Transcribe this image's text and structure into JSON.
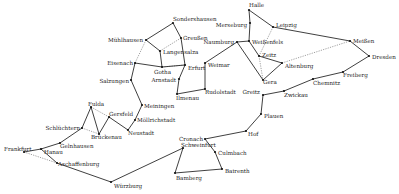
{
  "diagram": {
    "nodes": [
      {
        "id": "halle",
        "label": "Halle",
        "x": 249,
        "y": 10,
        "lx": 249,
        "ly": 6,
        "anchor": "start"
      },
      {
        "id": "leipzig",
        "label": "Leipzig",
        "x": 273,
        "y": 27,
        "lx": 276,
        "ly": 26,
        "anchor": "start"
      },
      {
        "id": "merseburg",
        "label": "Merseburg",
        "x": 250,
        "y": 23,
        "lx": 247,
        "ly": 26,
        "anchor": "end"
      },
      {
        "id": "naumburg",
        "label": "Naumburg",
        "x": 237,
        "y": 42,
        "lx": 234,
        "ly": 43,
        "anchor": "end"
      },
      {
        "id": "weissenfels",
        "label": "Weißenfels",
        "x": 249,
        "y": 41,
        "lx": 252,
        "ly": 43,
        "anchor": "start"
      },
      {
        "id": "zeitz",
        "label": "Zeitz",
        "x": 259,
        "y": 56,
        "lx": 262,
        "ly": 56,
        "anchor": "start"
      },
      {
        "id": "altenburg",
        "label": "Altenburg",
        "x": 282,
        "y": 63,
        "lx": 285,
        "ly": 67,
        "anchor": "start"
      },
      {
        "id": "gera",
        "label": "Gera",
        "x": 263,
        "y": 80,
        "lx": 263,
        "ly": 83,
        "anchor": "start"
      },
      {
        "id": "meissen",
        "label": "Meißen",
        "x": 350,
        "y": 41,
        "lx": 353,
        "ly": 42,
        "anchor": "start"
      },
      {
        "id": "dresden",
        "label": "Dresden",
        "x": 369,
        "y": 56,
        "lx": 372,
        "ly": 58,
        "anchor": "start"
      },
      {
        "id": "freiberg",
        "label": "Freiberg",
        "x": 343,
        "y": 72,
        "lx": 343,
        "ly": 76,
        "anchor": "start"
      },
      {
        "id": "chemnitz",
        "label": "Chemnitz",
        "x": 313,
        "y": 79,
        "lx": 313,
        "ly": 84,
        "anchor": "start"
      },
      {
        "id": "zwickau",
        "label": "Zwickau",
        "x": 284,
        "y": 91,
        "lx": 284,
        "ly": 96,
        "anchor": "start"
      },
      {
        "id": "greitz",
        "label": "Greitz",
        "x": 263,
        "y": 95,
        "lx": 260,
        "ly": 93,
        "anchor": "end"
      },
      {
        "id": "plauen",
        "label": "Plauen",
        "x": 261,
        "y": 114,
        "lx": 264,
        "ly": 117,
        "anchor": "start"
      },
      {
        "id": "hof",
        "label": "Hof",
        "x": 246,
        "y": 131,
        "lx": 248,
        "ly": 135,
        "anchor": "start"
      },
      {
        "id": "cronach",
        "label": "Cronach",
        "x": 205,
        "y": 139,
        "lx": 203,
        "ly": 140,
        "anchor": "end"
      },
      {
        "id": "culmbach",
        "label": "Culmbach",
        "x": 215,
        "y": 152,
        "lx": 218,
        "ly": 154,
        "anchor": "start"
      },
      {
        "id": "bairenth",
        "label": "Bairenth",
        "x": 222,
        "y": 169,
        "lx": 225,
        "ly": 172,
        "anchor": "start"
      },
      {
        "id": "bamberg",
        "label": "Bamberg",
        "x": 175,
        "y": 173,
        "lx": 176,
        "ly": 179,
        "anchor": "start"
      },
      {
        "id": "schweinfurt",
        "label": "Schweinfurt",
        "x": 183,
        "y": 148,
        "lx": 181,
        "ly": 146,
        "anchor": "start"
      },
      {
        "id": "wurzburg",
        "label": "Würzburg",
        "x": 111,
        "y": 182,
        "lx": 114,
        "ly": 187,
        "anchor": "start"
      },
      {
        "id": "aschaffenburg",
        "label": "Aschaffenburg",
        "x": 57,
        "y": 163,
        "lx": 58,
        "ly": 165,
        "anchor": "start"
      },
      {
        "id": "frankfurt",
        "label": "Frankfurt",
        "x": 24,
        "y": 152,
        "lx": 4,
        "ly": 150,
        "anchor": "start"
      },
      {
        "id": "hanau",
        "label": "Hanau",
        "x": 41,
        "y": 149,
        "lx": 44,
        "ly": 153,
        "anchor": "start"
      },
      {
        "id": "gelnhausen",
        "label": "Gelnhausen",
        "x": 60,
        "y": 143,
        "lx": 60,
        "ly": 147,
        "anchor": "start"
      },
      {
        "id": "schluchtern",
        "label": "Schlüchtern",
        "x": 82,
        "y": 128,
        "lx": 80,
        "ly": 129,
        "anchor": "end"
      },
      {
        "id": "bruckenau",
        "label": "Brückenau",
        "x": 99,
        "y": 134,
        "lx": 91,
        "ly": 138,
        "anchor": "start"
      },
      {
        "id": "fulda",
        "label": "Fulda",
        "x": 91,
        "y": 107,
        "lx": 88,
        "ly": 105,
        "anchor": "start"
      },
      {
        "id": "gersfeld",
        "label": "Gersfeld",
        "x": 109,
        "y": 117,
        "lx": 109,
        "ly": 115,
        "anchor": "start"
      },
      {
        "id": "neustadt",
        "label": "Neustadt",
        "x": 128,
        "y": 130,
        "lx": 128,
        "ly": 134,
        "anchor": "start"
      },
      {
        "id": "mellrichstadt",
        "label": "Möllrichstadt",
        "x": 135,
        "y": 120,
        "lx": 137,
        "ly": 121,
        "anchor": "start"
      },
      {
        "id": "meiningen",
        "label": "Meiningen",
        "x": 142,
        "y": 105,
        "lx": 144,
        "ly": 107,
        "anchor": "start"
      },
      {
        "id": "salzungen",
        "label": "Salzungen",
        "x": 131,
        "y": 80,
        "lx": 129,
        "ly": 82,
        "anchor": "end"
      },
      {
        "id": "eisenach",
        "label": "Eisenach",
        "x": 135,
        "y": 63,
        "lx": 133,
        "ly": 64,
        "anchor": "end"
      },
      {
        "id": "gotha",
        "label": "Gotha",
        "x": 162,
        "y": 67,
        "lx": 154,
        "ly": 73,
        "anchor": "start"
      },
      {
        "id": "arnstadt",
        "label": "Arnstadt",
        "x": 179,
        "y": 79,
        "lx": 176,
        "ly": 81,
        "anchor": "end"
      },
      {
        "id": "ilmenau",
        "label": "Ilmenau",
        "x": 177,
        "y": 94,
        "lx": 176,
        "ly": 99,
        "anchor": "start"
      },
      {
        "id": "rudolstadt",
        "label": "Rudolstadt",
        "x": 205,
        "y": 89,
        "lx": 205,
        "ly": 93,
        "anchor": "start"
      },
      {
        "id": "weimar",
        "label": "Weimar",
        "x": 205,
        "y": 63,
        "lx": 208,
        "ly": 66,
        "anchor": "start"
      },
      {
        "id": "erfurt",
        "label": "Erfurt",
        "x": 185,
        "y": 65,
        "lx": 188,
        "ly": 69,
        "anchor": "start"
      },
      {
        "id": "langensalza",
        "label": "Langensalza",
        "x": 160,
        "y": 51,
        "lx": 163,
        "ly": 53,
        "anchor": "start"
      },
      {
        "id": "muhlhausen",
        "label": "Mühlhausen",
        "x": 146,
        "y": 40,
        "lx": 143,
        "ly": 41,
        "anchor": "end"
      },
      {
        "id": "sondershausen",
        "label": "Sondershausen",
        "x": 173,
        "y": 23,
        "lx": 173,
        "ly": 20,
        "anchor": "start"
      },
      {
        "id": "greussen",
        "label": "Greußen",
        "x": 181,
        "y": 38,
        "lx": 183,
        "ly": 39,
        "anchor": "start"
      }
    ],
    "edges": [
      {
        "from": "halle",
        "to": "leipzig",
        "style": "solid"
      },
      {
        "from": "halle",
        "to": "merseburg",
        "style": "solid"
      },
      {
        "from": "merseburg",
        "to": "weissenfels",
        "style": "solid"
      },
      {
        "from": "weissenfels",
        "to": "naumburg",
        "style": "solid"
      },
      {
        "from": "weissenfels",
        "to": "zeitz",
        "style": "solid"
      },
      {
        "from": "leipzig",
        "to": "meissen",
        "style": "solid"
      },
      {
        "from": "leipzig",
        "to": "zeitz",
        "style": "dotted"
      },
      {
        "from": "meissen",
        "to": "dresden",
        "style": "solid"
      },
      {
        "from": "dresden",
        "to": "freiberg",
        "style": "solid"
      },
      {
        "from": "freiberg",
        "to": "chemnitz",
        "style": "solid"
      },
      {
        "from": "chemnitz",
        "to": "zwickau",
        "style": "solid"
      },
      {
        "from": "zwickau",
        "to": "greitz",
        "style": "solid"
      },
      {
        "from": "altenburg",
        "to": "meissen",
        "style": "dotted"
      },
      {
        "from": "zeitz",
        "to": "altenburg",
        "style": "solid"
      },
      {
        "from": "zeitz",
        "to": "gera",
        "style": "dotted"
      },
      {
        "from": "altenburg",
        "to": "gera",
        "style": "solid"
      },
      {
        "from": "naumburg",
        "to": "gera",
        "style": "solid"
      },
      {
        "from": "naumburg",
        "to": "weimar",
        "style": "solid"
      },
      {
        "from": "weimar",
        "to": "rudolstadt",
        "style": "solid"
      },
      {
        "from": "rudolstadt",
        "to": "ilmenau",
        "style": "solid"
      },
      {
        "from": "ilmenau",
        "to": "arnstadt",
        "style": "solid"
      },
      {
        "from": "arnstadt",
        "to": "erfurt",
        "style": "solid"
      },
      {
        "from": "erfurt",
        "to": "greussen",
        "style": "solid"
      },
      {
        "from": "greussen",
        "to": "sondershausen",
        "style": "solid"
      },
      {
        "from": "sondershausen",
        "to": "muhlhausen",
        "style": "solid"
      },
      {
        "from": "muhlhausen",
        "to": "langensalza",
        "style": "solid"
      },
      {
        "from": "muhlhausen",
        "to": "eisenach",
        "style": "dotted"
      },
      {
        "from": "greussen",
        "to": "langensalza",
        "style": "dotted"
      },
      {
        "from": "langensalza",
        "to": "gotha",
        "style": "solid"
      },
      {
        "from": "gotha",
        "to": "erfurt",
        "style": "dotted"
      },
      {
        "from": "eisenach",
        "to": "gotha",
        "style": "solid"
      },
      {
        "from": "gotha",
        "to": "erfurt",
        "style": "solid"
      },
      {
        "from": "eisenach",
        "to": "salzungen",
        "style": "solid"
      },
      {
        "from": "salzungen",
        "to": "meiningen",
        "style": "solid"
      },
      {
        "from": "meiningen",
        "to": "mellrichstadt",
        "style": "solid"
      },
      {
        "from": "mellrichstadt",
        "to": "neustadt",
        "style": "solid"
      },
      {
        "from": "neustadt",
        "to": "gersfeld",
        "style": "solid"
      },
      {
        "from": "gersfeld",
        "to": "bruckenau",
        "style": "solid"
      },
      {
        "from": "gersfeld",
        "to": "fulda",
        "style": "dotted"
      },
      {
        "from": "fulda",
        "to": "bruckenau",
        "style": "solid"
      },
      {
        "from": "fulda",
        "to": "schluchtern",
        "style": "solid"
      },
      {
        "from": "schluchtern",
        "to": "bruckenau",
        "style": "dotted"
      },
      {
        "from": "schluchtern",
        "to": "gelnhausen",
        "style": "solid"
      },
      {
        "from": "gelnhausen",
        "to": "hanau",
        "style": "solid"
      },
      {
        "from": "hanau",
        "to": "frankfurt",
        "style": "solid"
      },
      {
        "from": "hanau",
        "to": "aschaffenburg",
        "style": "solid"
      },
      {
        "from": "frankfurt",
        "to": "aschaffenburg",
        "style": "dotted"
      },
      {
        "from": "aschaffenburg",
        "to": "wurzburg",
        "style": "solid"
      },
      {
        "from": "wurzburg",
        "to": "schweinfurt",
        "style": "solid"
      },
      {
        "from": "schweinfurt",
        "to": "bamberg",
        "style": "solid"
      },
      {
        "from": "bamberg",
        "to": "bairenth",
        "style": "solid"
      },
      {
        "from": "bairenth",
        "to": "culmbach",
        "style": "solid"
      },
      {
        "from": "culmbach",
        "to": "cronach",
        "style": "solid"
      },
      {
        "from": "cronach",
        "to": "hof",
        "style": "solid"
      },
      {
        "from": "hof",
        "to": "plauen",
        "style": "solid"
      },
      {
        "from": "plauen",
        "to": "greitz",
        "style": "solid"
      }
    ]
  }
}
